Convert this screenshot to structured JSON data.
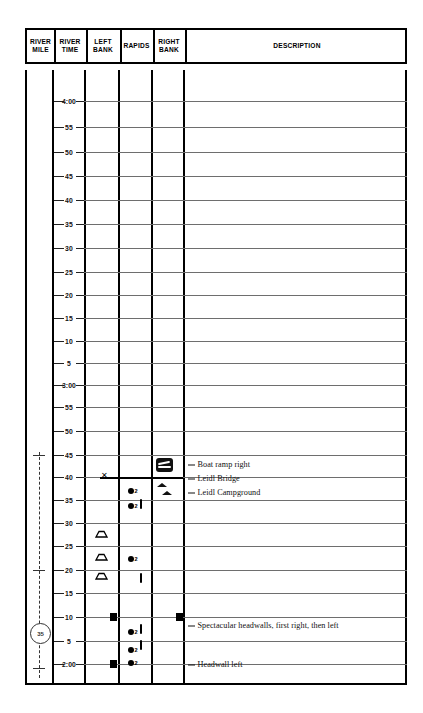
{
  "chart_data": {
    "type": "table",
    "columns": [
      {
        "id": "river-mile",
        "label": "RIVER\nMILE",
        "x": 25,
        "width": 27
      },
      {
        "id": "river-time",
        "label": "RIVER\nTIME",
        "x": 52,
        "width": 32
      },
      {
        "id": "left-bank",
        "label": "LEFT\nBANK",
        "x": 84,
        "width": 34
      },
      {
        "id": "rapids",
        "label": "RAPIDS",
        "x": 118,
        "width": 33
      },
      {
        "id": "right-bank",
        "label": "RIGHT\nBANK",
        "x": 151,
        "width": 32
      },
      {
        "id": "description",
        "label": "DESCRIPTION",
        "x": 183,
        "width": 224
      }
    ],
    "xlabel": "",
    "ylabel": "River time (descending)",
    "grid": true,
    "time_axis": {
      "orientation": "vertical-descending",
      "top_value": "4:00",
      "bottom_value": "2:00",
      "tick_interval_minutes": 5,
      "ticks": [
        {
          "label": "4:00",
          "y": 101
        },
        {
          "label": "55",
          "y": 127
        },
        {
          "label": "50",
          "y": 152
        },
        {
          "label": "45",
          "y": 176
        },
        {
          "label": "40",
          "y": 200
        },
        {
          "label": "35",
          "y": 224
        },
        {
          "label": "30",
          "y": 248
        },
        {
          "label": "25",
          "y": 272
        },
        {
          "label": "20",
          "y": 295
        },
        {
          "label": "15",
          "y": 318
        },
        {
          "label": "10",
          "y": 341
        },
        {
          "label": "5",
          "y": 363
        },
        {
          "label": "3:00",
          "y": 385
        },
        {
          "label": "55",
          "y": 407
        },
        {
          "label": "50",
          "y": 431
        },
        {
          "label": "45",
          "y": 455
        },
        {
          "label": "40",
          "y": 477
        },
        {
          "label": "35",
          "y": 500
        },
        {
          "label": "30",
          "y": 523
        },
        {
          "label": "25",
          "y": 546
        },
        {
          "label": "20",
          "y": 570
        },
        {
          "label": "15",
          "y": 593
        },
        {
          "label": "10",
          "y": 617
        },
        {
          "label": "5",
          "y": 641
        },
        {
          "label": "2:00",
          "y": 664
        }
      ]
    },
    "river_mile": {
      "marker_label": "35",
      "marker_y": 632,
      "dash_top": 452,
      "dash_bottom": 678,
      "ticks_y": [
        455,
        570,
        632,
        668
      ]
    },
    "left_bank": {
      "campsites_y": [
        528,
        551,
        570
      ],
      "bank_blocks_y": [
        617,
        664
      ]
    },
    "rapids": [
      {
        "class": "2",
        "y": 491
      },
      {
        "class": "2",
        "y": 506
      },
      {
        "class": "2",
        "y": 559
      },
      {
        "class": "2",
        "y": 632
      },
      {
        "class": "2",
        "y": 650
      },
      {
        "class": "2",
        "y": 663
      }
    ],
    "riffles_y": [
      504,
      578,
      629,
      645
    ],
    "right_bank": {
      "boat_ramp_y": 465,
      "rocks_y": [
        483,
        491
      ],
      "bank_blocks_y": [
        617
      ]
    },
    "descriptions": [
      {
        "text": "Boat ramp right",
        "y": 464
      },
      {
        "text": "Leidl Bridge",
        "y": 478
      },
      {
        "text": "Leidl Campground",
        "y": 492
      },
      {
        "text": "Spectacular headwalls, first right, then left",
        "y": 625
      },
      {
        "text": "Headwall left",
        "y": 664
      }
    ],
    "bridge": {
      "y": 477,
      "x_start": 100,
      "x_end": 183
    },
    "colors": {
      "ink": "#000000",
      "gridline": "#6e6e6e",
      "paper": "#ffffff",
      "text": "#111111"
    }
  }
}
